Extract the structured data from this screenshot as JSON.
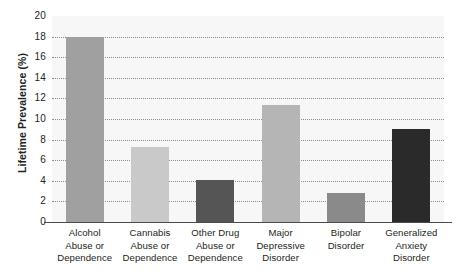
{
  "chart_data": {
    "type": "bar",
    "title": "",
    "xlabel": "",
    "ylabel": "Lifetime Prevalence (%)",
    "ylim": [
      0,
      20
    ],
    "yticks": [
      0,
      2,
      4,
      6,
      8,
      10,
      12,
      14,
      16,
      18,
      20
    ],
    "ytick_labels": [
      "0",
      "2",
      "4",
      "6",
      "8",
      "10",
      "12",
      "14",
      "16",
      "18",
      "20"
    ],
    "grid": true,
    "grid_style": "dotted-horizontal",
    "legend": "none",
    "categories": [
      "Alcohol Abuse or Dependence",
      "Cannabis Abuse or Dependence",
      "Other Drug Abuse or Dependence",
      "Major Depressive Disorder",
      "Bipolar Disorder",
      "Generalized Anxiety Disorder"
    ],
    "category_lines": [
      [
        "Alcohol",
        "Abuse or",
        "Dependence"
      ],
      [
        "Cannabis",
        "Abuse or",
        "Dependence"
      ],
      [
        "Other Drug",
        "Abuse or",
        "Dependence"
      ],
      [
        "Major",
        "Depressive",
        "Disorder"
      ],
      [
        "Bipolar",
        "Disorder"
      ],
      [
        "Generalized",
        "Anxiety",
        "Disorder"
      ]
    ],
    "values": [
      18.0,
      7.3,
      4.1,
      11.4,
      2.8,
      9.0
    ],
    "bar_colors": [
      "#a0a0a0",
      "#c9c9c9",
      "#555555",
      "#b5b5b5",
      "#8a8a8a",
      "#2a2a2a"
    ]
  },
  "style": {
    "plot_background": "#f7f7f7",
    "axis_line_color": "#4a4a4a",
    "gridline_color": "#8c8c8c",
    "text_color": "#231f20",
    "page_background": "#ffffff"
  }
}
